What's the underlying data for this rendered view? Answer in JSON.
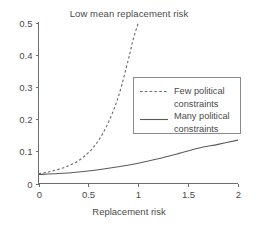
{
  "chart_data": {
    "type": "line",
    "title": "Low mean replacement risk",
    "xlabel": "Replacement risk",
    "ylabel": "",
    "xlim": [
      0,
      2
    ],
    "ylim": [
      0,
      0.5
    ],
    "xticks": [
      "0",
      "0.5",
      "1",
      "1.5",
      "2"
    ],
    "xtick_values": [
      0,
      0.5,
      1,
      1.5,
      2
    ],
    "yticks": [
      "0",
      "0.1",
      "0.2",
      "0.3",
      "0.4",
      "0.5"
    ],
    "ytick_values": [
      0,
      0.1,
      0.2,
      0.3,
      0.4,
      0.5
    ],
    "grid": false,
    "legend_position": "center-right",
    "series": [
      {
        "name": "Few political constraints",
        "style": "dashed",
        "color": "#6a6a6a",
        "x": [
          0,
          0.1,
          0.2,
          0.3,
          0.4,
          0.5,
          0.6,
          0.7,
          0.8,
          0.9,
          0.95,
          1.0
        ],
        "values": [
          0.03,
          0.036,
          0.044,
          0.055,
          0.071,
          0.096,
          0.133,
          0.19,
          0.27,
          0.385,
          0.45,
          0.5
        ]
      },
      {
        "name": "Many political constraints",
        "style": "solid",
        "color": "#5a5a5a",
        "x": [
          0,
          0.2,
          0.4,
          0.6,
          0.8,
          1.0,
          1.2,
          1.4,
          1.6,
          1.8,
          2.0
        ],
        "values": [
          0.028,
          0.031,
          0.036,
          0.043,
          0.052,
          0.063,
          0.077,
          0.093,
          0.11,
          0.122,
          0.135
        ]
      }
    ]
  },
  "legend": {
    "entries": [
      {
        "line1": "Few political",
        "line2": "constraints"
      },
      {
        "line1": "Many political",
        "line2": "constraints"
      }
    ]
  },
  "colors": {
    "background": "#ffffff",
    "axis": "#6d6d6d",
    "text": "#4a4a4a",
    "legend_border": "#8a8a8a"
  }
}
